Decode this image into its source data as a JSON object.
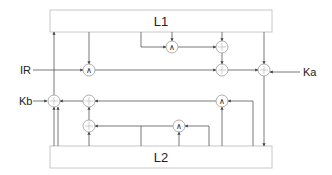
{
  "diagram": {
    "blocks": {
      "top": {
        "label": "L1"
      },
      "bottom": {
        "label": "L2"
      }
    },
    "inputs": {
      "ir": "IR",
      "ka": "Ka",
      "kb": "Kb"
    },
    "operators": {
      "and": "∧",
      "sum": "+"
    },
    "nodes": [
      {
        "id": "and-ir",
        "type": "and"
      },
      {
        "id": "and-top",
        "type": "and"
      },
      {
        "id": "sum-top-1",
        "type": "sum"
      },
      {
        "id": "sum-top-2",
        "type": "sum"
      },
      {
        "id": "sum-ka",
        "type": "sum"
      },
      {
        "id": "sum-kb",
        "type": "sum"
      },
      {
        "id": "sum-mid-1",
        "type": "sum"
      },
      {
        "id": "sum-mid-2",
        "type": "sum"
      },
      {
        "id": "and-bottom",
        "type": "and"
      },
      {
        "id": "and-mid",
        "type": "and"
      }
    ]
  }
}
